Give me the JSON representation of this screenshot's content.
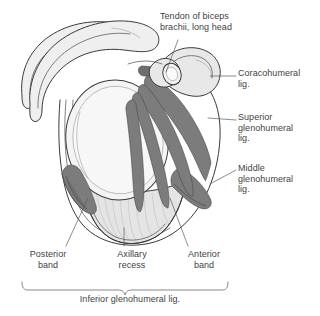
{
  "figure": {
    "colors": {
      "text": "#3f3f3f",
      "outline": "#3a3a3a",
      "bone_fill": "#efefef",
      "glenoid_fill": "#f4f4f4",
      "ligament_fill": "#7c7c7c",
      "capsule_fill": "#e2e2e2",
      "leader_line": "#5a5a5a",
      "background": "#ffffff"
    }
  },
  "labels": {
    "tendon_biceps": "Tendon of biceps\nbrachii, long head",
    "coracohumeral": "Coracohumeral\nlig.",
    "superior_glenohumeral": "Superior\nglenohumeral\nlig.",
    "middle_glenohumeral": "Middle\nglenohumeral\nlig.",
    "posterior_band": "Posterior\nband",
    "axillary_recess": "Axillary\nrecess",
    "anterior_band": "Anterior\nband",
    "inferior_glenohumeral": "Inferior glenohumeral lig."
  },
  "structures": {
    "acromion": "acromion",
    "scapular_spine": "scapular-spine",
    "coracoid_process": "coracoid-process",
    "glenoid_fossa": "glenoid-fossa",
    "biceps_tendon_section": "biceps-tendon-cross-section",
    "joint_capsule": "joint-capsule",
    "axillary_pouch": "axillary-pouch"
  }
}
